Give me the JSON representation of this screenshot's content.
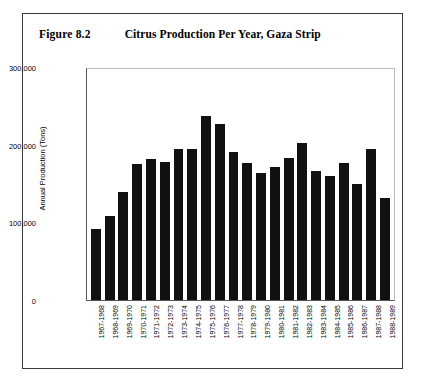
{
  "figure": {
    "number": "Figure 8.2",
    "title": "Citrus Production Per Year, Gaza Strip"
  },
  "chart_data": {
    "type": "bar",
    "title": "Citrus Production Per Year, Gaza Strip",
    "xlabel": "",
    "ylabel": "Annual Production (Tons)",
    "ylim": [
      0,
      300000
    ],
    "yticks": [
      0,
      100000,
      200000,
      300000
    ],
    "ytick_labels": [
      "0",
      "100,000",
      "200,000",
      "300,000"
    ],
    "grid": false,
    "legend": null,
    "bar_color": "#111111",
    "categories": [
      "1967-1968",
      "1968-1969",
      "1969-1970",
      "1970-1971",
      "1971-1972",
      "1972-1973",
      "1973-1974",
      "1974-1975",
      "1975-1976",
      "1976-1977",
      "1977-1978",
      "1978-1979",
      "1979-1980",
      "1980-1981",
      "1981-1982",
      "1982-1983",
      "1983-1984",
      "1984-1985",
      "1985-1986",
      "1986-1987",
      "1987-1988",
      "1988-1989"
    ],
    "values": [
      92000,
      108000,
      139000,
      175000,
      181000,
      178000,
      194000,
      195000,
      237000,
      226000,
      190000,
      176000,
      163000,
      171000,
      183000,
      202000,
      166000,
      160000,
      176000,
      150000,
      194000,
      131000
    ]
  }
}
